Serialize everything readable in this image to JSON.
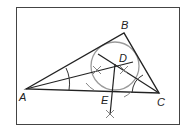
{
  "diagram": {
    "frame": {
      "x": 16,
      "y": 7,
      "width": 164,
      "height": 118,
      "stroke": "#444444"
    },
    "vertices": {
      "A": {
        "label": "A",
        "x": 26,
        "y": 89,
        "label_x": 19,
        "label_y": 101
      },
      "B": {
        "label": "B",
        "x": 124,
        "y": 33,
        "label_x": 121,
        "label_y": 29
      },
      "C": {
        "label": "C",
        "x": 159,
        "y": 93,
        "label_x": 157,
        "label_y": 106
      }
    },
    "incenter": {
      "label": "D",
      "x": 115,
      "y": 66,
      "label_x": 119,
      "label_y": 62
    },
    "tangent_point": {
      "label": "E",
      "x": 112,
      "y": 92,
      "label_x": 101,
      "label_y": 104
    },
    "incircle": {
      "cx": 115,
      "cy": 66,
      "r": 24,
      "stroke": "#999999"
    },
    "line_color": "#222222",
    "arc_color": "#555555"
  }
}
